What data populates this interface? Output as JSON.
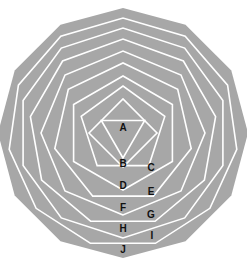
{
  "diagram": {
    "fill_color": "#a7a7a7",
    "line_color": "#ffffff",
    "label_color": "#111111",
    "center_x": 123,
    "polygons": [
      {
        "label": "A",
        "sides": 3,
        "cy": 133,
        "r": 25,
        "rotation_deg": 0
      },
      {
        "label": "B",
        "sides": 4,
        "cy": 133,
        "r": 34,
        "rotation_deg": 0
      },
      {
        "label": "C",
        "sides": 5,
        "cy": 130,
        "r": 44,
        "rotation_deg": 36
      },
      {
        "label": "D",
        "sides": 6,
        "cy": 133,
        "r": 57,
        "rotation_deg": 0
      },
      {
        "label": "E",
        "sides": 7,
        "cy": 133,
        "r": 70,
        "rotation_deg": 25.71
      },
      {
        "label": "F",
        "sides": 8,
        "cy": 133,
        "r": 82,
        "rotation_deg": 0
      },
      {
        "label": "G",
        "sides": 9,
        "cy": 133,
        "r": 94,
        "rotation_deg": 20
      },
      {
        "label": "H",
        "sides": 10,
        "cy": 133,
        "r": 105,
        "rotation_deg": 0
      },
      {
        "label": "I",
        "sides": 11,
        "cy": 133,
        "r": 115,
        "rotation_deg": 16.36
      },
      {
        "label": "J",
        "sides": 12,
        "cy": 133,
        "r": 125,
        "rotation_deg": 0
      }
    ],
    "labels": [
      {
        "text": "A",
        "x": 123,
        "y": 131
      },
      {
        "text": "B",
        "x": 123,
        "y": 167
      },
      {
        "text": "C",
        "x": 151,
        "y": 171
      },
      {
        "text": "D",
        "x": 123,
        "y": 189
      },
      {
        "text": "E",
        "x": 151,
        "y": 195
      },
      {
        "text": "F",
        "x": 123,
        "y": 211
      },
      {
        "text": "G",
        "x": 151,
        "y": 218
      },
      {
        "text": "H",
        "x": 123,
        "y": 232
      },
      {
        "text": "I",
        "x": 152,
        "y": 239
      },
      {
        "text": "J",
        "x": 123,
        "y": 253
      }
    ]
  }
}
